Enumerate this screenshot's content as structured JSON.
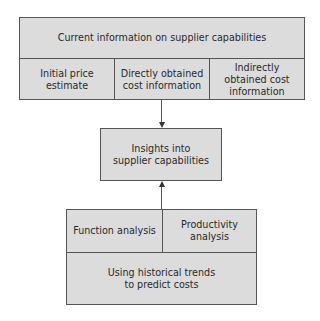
{
  "top_box": {
    "header": "Current information on supplier capabilities",
    "columns": [
      "Initial price estimate",
      "Directly obtained cost information",
      "Indirectly obtained cost information"
    ]
  },
  "middle_box": {
    "label": "Insights into supplier capabilities"
  },
  "bottom_box": {
    "columns": [
      "Function analysis",
      "Productivity analysis"
    ],
    "footer": "Using historical trends to predict costs"
  },
  "colors": {
    "box_fill": "#dcdcdc",
    "border": "#555555",
    "text": "#2a2a2a"
  }
}
